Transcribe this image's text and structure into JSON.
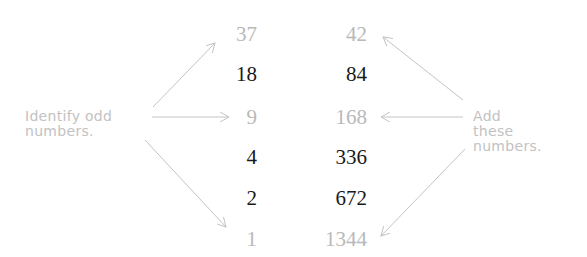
{
  "left_label": {
    "lines": [
      "Identify odd",
      "numbers."
    ]
  },
  "right_label": {
    "lines": [
      "Add",
      "these",
      "numbers."
    ]
  },
  "rows": [
    {
      "left": "37",
      "right": "42",
      "highlighted": true
    },
    {
      "left": "18",
      "right": "84",
      "highlighted": false
    },
    {
      "left": "9",
      "right": "168",
      "highlighted": true
    },
    {
      "left": "4",
      "right": "336",
      "highlighted": false
    },
    {
      "left": "2",
      "right": "672",
      "highlighted": false
    },
    {
      "left": "1",
      "right": "1344",
      "highlighted": true
    }
  ],
  "colors": {
    "highlighted_number": "#b9b9b9",
    "normal_number": "#1a1a1a",
    "label": "#c2c2c2",
    "arrow": "#c4c4c4"
  }
}
